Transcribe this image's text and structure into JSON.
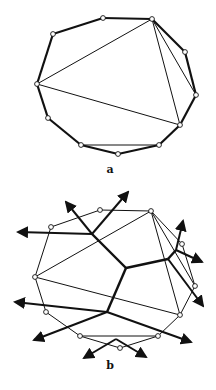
{
  "figure_a": {
    "label": "a",
    "vertices": [
      [
        53,
        34
      ],
      [
        103,
        18
      ],
      [
        152,
        19
      ],
      [
        185,
        52
      ],
      [
        196,
        95
      ],
      [
        180,
        125
      ],
      [
        159,
        145
      ],
      [
        118,
        154
      ],
      [
        81,
        145
      ],
      [
        48,
        118
      ],
      [
        37,
        84
      ]
    ],
    "diagonals": [
      [
        37,
        84,
        152,
        19
      ],
      [
        37,
        84,
        180,
        125
      ],
      [
        152,
        19,
        180,
        125
      ],
      [
        152,
        19,
        196,
        95
      ],
      [
        81,
        145,
        159,
        145
      ]
    ]
  },
  "figure_b": {
    "label": "b",
    "vertices": [
      [
        51,
        227
      ],
      [
        100,
        210
      ],
      [
        151,
        211
      ],
      [
        182,
        244
      ],
      [
        195,
        286
      ],
      [
        180,
        315
      ],
      [
        158,
        336
      ],
      [
        120,
        348
      ],
      [
        80,
        336
      ],
      [
        46,
        312
      ],
      [
        35,
        277
      ]
    ],
    "diagonals": [
      [
        35,
        277,
        151,
        211
      ],
      [
        35,
        277,
        180,
        315
      ],
      [
        151,
        211,
        180,
        315
      ],
      [
        151,
        211,
        195,
        286
      ],
      [
        80,
        336,
        158,
        336
      ]
    ],
    "dual_edges": [
      [
        92,
        234,
        126,
        268
      ],
      [
        126,
        268,
        168,
        259
      ],
      [
        126,
        268,
        107,
        312
      ],
      [
        168,
        259,
        176,
        250
      ]
    ],
    "arrows": [
      [
        92,
        234,
        18,
        232
      ],
      [
        92,
        234,
        66,
        202
      ],
      [
        92,
        234,
        128,
        192
      ],
      [
        176,
        250,
        183,
        221
      ],
      [
        176,
        250,
        202,
        262
      ],
      [
        168,
        259,
        203,
        306
      ],
      [
        107,
        312,
        15,
        302
      ],
      [
        107,
        312,
        34,
        340
      ],
      [
        107,
        312,
        191,
        342
      ],
      [
        116,
        339,
        84,
        358
      ],
      [
        116,
        339,
        146,
        357
      ]
    ]
  }
}
